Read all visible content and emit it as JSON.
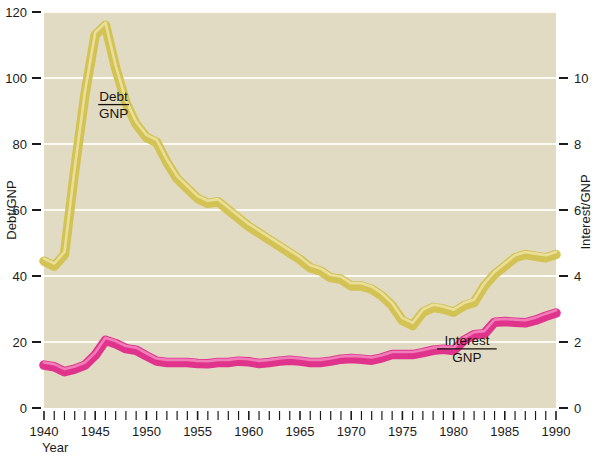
{
  "figure": {
    "background_color": "#ffffff",
    "plot_background_color": "#e2dbc4",
    "gridline_color": "#fdfbf2",
    "axis_color": "#1b1b1b"
  },
  "chart_data": {
    "type": "line",
    "title": "",
    "subtitle": "",
    "xlabel": "Year",
    "ylabel": "Debt/GNP",
    "y2label": "Interest/GNP",
    "xlim": [
      1940,
      1990
    ],
    "ylim": [
      0,
      120
    ],
    "y2lim": [
      0,
      12
    ],
    "grid": true,
    "gridlines_y": [
      20,
      40,
      60,
      80,
      100,
      120
    ],
    "legend_position": "inline-annotations",
    "xticks_major": [
      1940,
      1945,
      1950,
      1955,
      1960,
      1965,
      1970,
      1975,
      1980,
      1985,
      1990
    ],
    "xticks_minor_step": 1,
    "yticks_left": [
      0,
      20,
      40,
      60,
      80,
      100,
      120
    ],
    "yticks_right": [
      0,
      2,
      4,
      6,
      8,
      10
    ],
    "x": [
      1940,
      1941,
      1942,
      1943,
      1944,
      1945,
      1946,
      1947,
      1948,
      1949,
      1950,
      1951,
      1952,
      1953,
      1954,
      1955,
      1956,
      1957,
      1958,
      1959,
      1960,
      1961,
      1962,
      1963,
      1964,
      1965,
      1966,
      1967,
      1968,
      1969,
      1970,
      1971,
      1972,
      1973,
      1974,
      1975,
      1976,
      1977,
      1978,
      1979,
      1980,
      1981,
      1982,
      1983,
      1984,
      1985,
      1986,
      1987,
      1988,
      1989,
      1990
    ],
    "series": [
      {
        "name": "Debt/GNP",
        "axis": "left",
        "color": "#d2c24e",
        "highlight_color": "#ece2a2",
        "units": "percent",
        "values": [
          44.5,
          43.0,
          46.5,
          72.0,
          95.0,
          113.0,
          116.0,
          103.0,
          92.5,
          86.0,
          82.0,
          80.5,
          74.5,
          69.5,
          66.5,
          63.5,
          62.0,
          62.5,
          60.0,
          57.5,
          55.0,
          53.0,
          51.0,
          49.0,
          47.0,
          45.0,
          42.5,
          41.5,
          39.5,
          39.0,
          37.0,
          37.0,
          36.0,
          34.0,
          31.0,
          26.5,
          25.0,
          29.0,
          30.5,
          30.0,
          29.0,
          31.0,
          32.0,
          37.0,
          40.5,
          43.0,
          45.5,
          46.5,
          46.0,
          45.5,
          46.5
        ]
      },
      {
        "name": "Interest/GNP",
        "axis": "right",
        "color": "#df2b89",
        "highlight_color": "#f285bd",
        "units": "percent",
        "values": [
          1.3,
          1.25,
          1.1,
          1.18,
          1.3,
          1.6,
          2.05,
          1.95,
          1.8,
          1.75,
          1.58,
          1.42,
          1.38,
          1.38,
          1.38,
          1.35,
          1.34,
          1.38,
          1.38,
          1.42,
          1.4,
          1.35,
          1.38,
          1.42,
          1.45,
          1.42,
          1.38,
          1.38,
          1.42,
          1.48,
          1.5,
          1.48,
          1.45,
          1.52,
          1.62,
          1.62,
          1.62,
          1.68,
          1.75,
          1.78,
          1.74,
          2.05,
          2.22,
          2.25,
          2.6,
          2.62,
          2.6,
          2.58,
          2.66,
          2.78,
          2.88
        ]
      }
    ],
    "annotations": [
      {
        "name": "debt-gnp-label",
        "numerator": "Debt",
        "denominator": "GNP",
        "x": 1946.8,
        "y": 93
      },
      {
        "name": "interest-gnp-label",
        "numerator": "Interest",
        "denominator": "GNP",
        "x": 1981.3,
        "y": 19
      }
    ]
  },
  "axes": {
    "left": {
      "title": "Debt/GNP",
      "ticks": [
        "0",
        "20",
        "40",
        "60",
        "80",
        "100",
        "120"
      ]
    },
    "right": {
      "title": "Interest/GNP",
      "ticks": [
        "0",
        "2",
        "4",
        "6",
        "8",
        "10"
      ]
    },
    "bottom": {
      "title": "Year",
      "ticks": [
        "1940",
        "1945",
        "1950",
        "1955",
        "1960",
        "1965",
        "1970",
        "1975",
        "1980",
        "1985",
        "1990"
      ]
    }
  }
}
